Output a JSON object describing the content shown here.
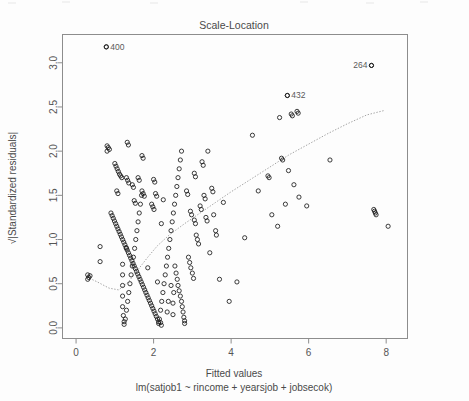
{
  "chart_data": {
    "type": "scatter",
    "title": "Scale-Location",
    "xlabel": "Fitted values",
    "sublabel": "lm(satjob1 ~ rincome + yearsjob + jobsecok)",
    "ylabel": "√|Standardized residuals|",
    "xlim": [
      -0.35,
      8.55
    ],
    "ylim": [
      -0.12,
      3.32
    ],
    "xticks": [
      0,
      2,
      4,
      6,
      8
    ],
    "xticklabels": [
      "0",
      "2",
      "4",
      "6",
      "8"
    ],
    "yticks": [
      0.0,
      0.5,
      1.0,
      1.5,
      2.0,
      2.5,
      3.0
    ],
    "yticklabels": [
      "0.0",
      "0.5",
      "1.0",
      "1.5",
      "2.0",
      "2.5",
      "3.0"
    ],
    "grid": false,
    "legend": null,
    "marker": "open-circle",
    "annotations": [
      {
        "label": "400",
        "x": 0.78,
        "y": 3.18,
        "side": "right"
      },
      {
        "label": "432",
        "x": 5.45,
        "y": 2.63,
        "side": "right"
      },
      {
        "label": "264",
        "x": 7.62,
        "y": 2.97,
        "side": "left"
      }
    ],
    "trend_line": {
      "style": "dotted",
      "color": "#9a9a9a",
      "points": [
        [
          0.28,
          0.575
        ],
        [
          0.55,
          0.52
        ],
        [
          0.85,
          0.45
        ],
        [
          1.1,
          0.43
        ],
        [
          1.35,
          0.52
        ],
        [
          1.6,
          0.66
        ],
        [
          1.85,
          0.8
        ],
        [
          2.1,
          0.93
        ],
        [
          2.4,
          1.05
        ],
        [
          2.8,
          1.18
        ],
        [
          3.2,
          1.3
        ],
        [
          3.6,
          1.42
        ],
        [
          4.0,
          1.54
        ],
        [
          4.5,
          1.68
        ],
        [
          5.0,
          1.82
        ],
        [
          5.5,
          1.96
        ],
        [
          6.0,
          2.08
        ],
        [
          6.5,
          2.2
        ],
        [
          7.0,
          2.31
        ],
        [
          7.5,
          2.41
        ],
        [
          7.95,
          2.46
        ]
      ]
    },
    "points": [
      [
        0.3,
        0.55
      ],
      [
        0.33,
        0.57
      ],
      [
        0.36,
        0.59
      ],
      [
        0.3,
        0.6
      ],
      [
        0.78,
        3.18
      ],
      [
        0.8,
        2.06
      ],
      [
        0.83,
        2.04
      ],
      [
        0.86,
        2.02
      ],
      [
        0.8,
        2.0
      ],
      [
        1.0,
        1.86
      ],
      [
        1.03,
        1.83
      ],
      [
        1.06,
        1.8
      ],
      [
        1.09,
        1.77
      ],
      [
        1.12,
        1.74
      ],
      [
        1.15,
        1.72
      ],
      [
        1.18,
        1.7
      ],
      [
        1.3,
        1.7
      ],
      [
        1.33,
        1.67
      ],
      [
        1.36,
        1.64
      ],
      [
        1.45,
        1.62
      ],
      [
        1.48,
        1.59
      ],
      [
        0.62,
        0.92
      ],
      [
        0.62,
        0.75
      ],
      [
        0.9,
        1.3
      ],
      [
        0.93,
        1.27
      ],
      [
        0.96,
        1.24
      ],
      [
        0.99,
        1.21
      ],
      [
        1.02,
        1.18
      ],
      [
        1.05,
        1.15
      ],
      [
        1.08,
        1.12
      ],
      [
        1.11,
        1.09
      ],
      [
        1.14,
        1.06
      ],
      [
        1.17,
        1.03
      ],
      [
        1.2,
        1.0
      ],
      [
        1.23,
        0.97
      ],
      [
        1.26,
        0.94
      ],
      [
        1.29,
        0.91
      ],
      [
        1.32,
        0.88
      ],
      [
        1.35,
        0.85
      ],
      [
        1.38,
        0.82
      ],
      [
        1.41,
        0.79
      ],
      [
        1.44,
        0.76
      ],
      [
        1.47,
        0.73
      ],
      [
        1.5,
        0.7
      ],
      [
        1.53,
        0.67
      ],
      [
        1.56,
        0.64
      ],
      [
        1.59,
        0.61
      ],
      [
        1.62,
        0.58
      ],
      [
        1.65,
        0.55
      ],
      [
        1.68,
        0.52
      ],
      [
        1.71,
        0.49
      ],
      [
        1.74,
        0.46
      ],
      [
        1.77,
        0.43
      ],
      [
        1.8,
        0.4
      ],
      [
        1.83,
        0.37
      ],
      [
        1.86,
        0.34
      ],
      [
        1.89,
        0.31
      ],
      [
        1.92,
        0.28
      ],
      [
        1.95,
        0.25
      ],
      [
        1.98,
        0.22
      ],
      [
        2.01,
        0.19
      ],
      [
        2.04,
        0.16
      ],
      [
        2.07,
        0.13
      ],
      [
        2.1,
        0.1
      ],
      [
        2.13,
        0.07
      ],
      [
        2.13,
        0.05
      ],
      [
        1.2,
        0.72
      ],
      [
        1.2,
        0.6
      ],
      [
        1.2,
        0.48
      ],
      [
        1.2,
        0.36
      ],
      [
        1.2,
        0.24
      ],
      [
        1.22,
        0.14
      ],
      [
        1.24,
        0.07
      ],
      [
        1.24,
        0.04
      ],
      [
        1.27,
        0.1
      ],
      [
        1.3,
        0.2
      ],
      [
        1.33,
        0.3
      ],
      [
        1.36,
        0.4
      ],
      [
        1.39,
        0.5
      ],
      [
        1.42,
        0.6
      ],
      [
        1.45,
        0.7
      ],
      [
        1.48,
        0.8
      ],
      [
        1.51,
        0.9
      ],
      [
        1.54,
        1.0
      ],
      [
        1.57,
        1.1
      ],
      [
        1.6,
        1.2
      ],
      [
        1.63,
        1.3
      ],
      [
        1.66,
        1.4
      ],
      [
        1.69,
        1.5
      ],
      [
        1.3,
        0.9
      ],
      [
        1.5,
        1.44
      ],
      [
        1.53,
        1.41
      ],
      [
        1.7,
        1.55
      ],
      [
        1.73,
        1.52
      ],
      [
        1.76,
        1.49
      ],
      [
        1.6,
        1.7
      ],
      [
        1.63,
        1.67
      ],
      [
        1.7,
        1.95
      ],
      [
        1.73,
        1.92
      ],
      [
        1.95,
        1.4
      ],
      [
        1.98,
        1.37
      ],
      [
        2.01,
        1.34
      ],
      [
        2.05,
        1.52
      ],
      [
        2.08,
        1.49
      ],
      [
        2.0,
        1.68
      ],
      [
        2.03,
        1.65
      ],
      [
        1.32,
        2.1
      ],
      [
        1.35,
        2.07
      ],
      [
        1.05,
        1.55
      ],
      [
        1.08,
        1.52
      ],
      [
        2.15,
        0.1
      ],
      [
        2.18,
        0.2
      ],
      [
        2.21,
        0.3
      ],
      [
        2.24,
        0.4
      ],
      [
        2.27,
        0.5
      ],
      [
        2.3,
        0.6
      ],
      [
        2.33,
        0.7
      ],
      [
        2.36,
        0.8
      ],
      [
        2.39,
        0.9
      ],
      [
        2.42,
        1.0
      ],
      [
        2.45,
        1.1
      ],
      [
        2.48,
        1.2
      ],
      [
        2.51,
        1.3
      ],
      [
        2.54,
        1.4
      ],
      [
        2.57,
        1.5
      ],
      [
        2.6,
        1.6
      ],
      [
        2.63,
        1.7
      ],
      [
        2.66,
        1.8
      ],
      [
        2.69,
        1.9
      ],
      [
        2.72,
        2.0
      ],
      [
        2.18,
        0.06
      ],
      [
        2.2,
        0.03
      ],
      [
        2.5,
        0.15
      ],
      [
        2.5,
        0.28
      ],
      [
        2.52,
        0.4
      ],
      [
        2.35,
        0.18
      ],
      [
        2.38,
        0.3
      ],
      [
        2.55,
        0.7
      ],
      [
        2.58,
        0.62
      ],
      [
        2.61,
        0.55
      ],
      [
        2.63,
        0.48
      ],
      [
        2.66,
        0.42
      ],
      [
        2.69,
        0.36
      ],
      [
        2.72,
        0.3
      ],
      [
        2.74,
        0.24
      ],
      [
        2.76,
        0.18
      ],
      [
        2.78,
        0.12
      ],
      [
        2.8,
        0.08
      ],
      [
        2.9,
        0.8
      ],
      [
        2.93,
        0.74
      ],
      [
        2.96,
        0.68
      ],
      [
        3.0,
        0.62
      ],
      [
        3.03,
        0.56
      ],
      [
        3.1,
        1.05
      ],
      [
        3.13,
        1.0
      ],
      [
        3.16,
        0.95
      ],
      [
        3.05,
        1.22
      ],
      [
        3.08,
        1.18
      ],
      [
        2.95,
        1.32
      ],
      [
        2.98,
        1.28
      ],
      [
        3.2,
        1.38
      ],
      [
        3.23,
        1.34
      ],
      [
        3.35,
        1.25
      ],
      [
        3.38,
        1.21
      ],
      [
        3.3,
        1.5
      ],
      [
        3.33,
        1.46
      ],
      [
        3.5,
        1.58
      ],
      [
        3.53,
        1.54
      ],
      [
        2.85,
        1.55
      ],
      [
        2.88,
        1.51
      ],
      [
        3.05,
        1.75
      ],
      [
        3.08,
        1.71
      ],
      [
        3.25,
        1.88
      ],
      [
        3.28,
        1.84
      ],
      [
        3.4,
        2.0
      ],
      [
        3.45,
        0.85
      ],
      [
        3.6,
        1.1
      ],
      [
        3.62,
        1.05
      ],
      [
        3.7,
        0.55
      ],
      [
        3.8,
        1.42
      ],
      [
        3.55,
        1.28
      ],
      [
        2.2,
        1.18
      ],
      [
        2.45,
        0.48
      ],
      [
        2.8,
        0.05
      ],
      [
        4.35,
        1.02
      ],
      [
        4.55,
        2.18
      ],
      [
        4.7,
        1.55
      ],
      [
        4.95,
        1.72
      ],
      [
        4.98,
        1.7
      ],
      [
        5.05,
        1.28
      ],
      [
        5.2,
        1.15
      ],
      [
        5.3,
        1.92
      ],
      [
        5.33,
        1.9
      ],
      [
        5.45,
        2.63
      ],
      [
        5.55,
        2.42
      ],
      [
        5.58,
        2.4
      ],
      [
        5.7,
        2.45
      ],
      [
        5.73,
        2.43
      ],
      [
        5.25,
        2.38
      ],
      [
        5.48,
        1.78
      ],
      [
        5.62,
        1.62
      ],
      [
        5.4,
        1.4
      ],
      [
        5.75,
        1.48
      ],
      [
        5.95,
        1.38
      ],
      [
        7.62,
        2.97
      ],
      [
        7.68,
        1.34
      ],
      [
        7.7,
        1.32
      ],
      [
        7.72,
        1.3
      ],
      [
        7.74,
        1.28
      ],
      [
        8.05,
        1.15
      ],
      [
        4.15,
        0.52
      ],
      [
        3.95,
        0.3
      ],
      [
        6.55,
        1.9
      ],
      [
        2.1,
        0.52
      ],
      [
        1.85,
        0.68
      ],
      [
        2.25,
        1.45
      ]
    ]
  }
}
